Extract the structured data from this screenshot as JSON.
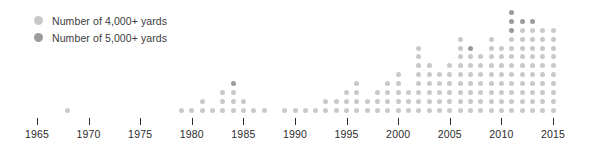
{
  "legend": {
    "position": "top-left",
    "items": [
      {
        "label": "Number of 4,000+ yards",
        "color": "#c9c9c9",
        "key": "y4000"
      },
      {
        "label": "Number of 5,000+ yards",
        "color": "#9b9b9b",
        "key": "y5000"
      }
    ]
  },
  "axis": {
    "ticks": [
      1965,
      1970,
      1975,
      1980,
      1985,
      1990,
      1995,
      2000,
      2005,
      2010,
      2015
    ],
    "tick_labels": [
      "1965",
      "1970",
      "1975",
      "1980",
      "1985",
      "1990",
      "1995",
      "2000",
      "2005",
      "2010",
      "2015"
    ]
  },
  "chart_data": {
    "type": "scatter",
    "subtype": "dot-plot-stacked",
    "title": "",
    "subtitle": "",
    "xlabel": "",
    "ylabel": "",
    "xlim": [
      1964,
      2016
    ],
    "ylim": [
      0,
      13
    ],
    "grid": false,
    "legend_position": "top-left",
    "dot_unit": 1,
    "categories": [
      1965,
      1966,
      1967,
      1968,
      1969,
      1970,
      1971,
      1972,
      1973,
      1974,
      1975,
      1976,
      1977,
      1978,
      1979,
      1980,
      1981,
      1982,
      1983,
      1984,
      1985,
      1986,
      1987,
      1988,
      1989,
      1990,
      1991,
      1992,
      1993,
      1994,
      1995,
      1996,
      1997,
      1998,
      1999,
      2000,
      2001,
      2002,
      2003,
      2004,
      2005,
      2006,
      2007,
      2008,
      2009,
      2010,
      2011,
      2012,
      2013,
      2014,
      2015
    ],
    "series": [
      {
        "name": "Number of 4,000+ yards",
        "color": "#c9c9c9",
        "values": [
          0,
          0,
          0,
          1,
          0,
          0,
          0,
          0,
          0,
          0,
          0,
          0,
          0,
          0,
          1,
          1,
          2,
          1,
          3,
          3,
          2,
          1,
          1,
          0,
          1,
          1,
          1,
          1,
          2,
          2,
          3,
          4,
          2,
          3,
          4,
          5,
          3,
          8,
          6,
          5,
          6,
          9,
          7,
          7,
          9,
          8,
          9,
          10,
          10,
          10,
          10
        ]
      },
      {
        "name": "Number of 5,000+ yards",
        "color": "#9b9b9b",
        "values": [
          0,
          0,
          0,
          0,
          0,
          0,
          0,
          0,
          0,
          0,
          0,
          0,
          0,
          0,
          0,
          0,
          0,
          0,
          0,
          1,
          0,
          0,
          0,
          0,
          0,
          0,
          0,
          0,
          0,
          0,
          0,
          0,
          0,
          0,
          0,
          0,
          0,
          0,
          0,
          0,
          0,
          0,
          1,
          0,
          0,
          0,
          3,
          1,
          1,
          0,
          0
        ]
      }
    ]
  }
}
